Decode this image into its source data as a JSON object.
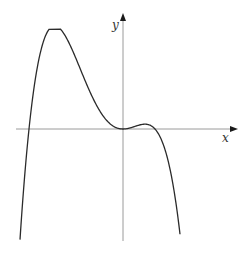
{
  "chart_data": {
    "type": "line",
    "title": "",
    "xlabel": "x",
    "ylabel": "y",
    "grid": false,
    "legend": null,
    "ticks": [],
    "features": {
      "roots_px": [
        29,
        123,
        155
      ],
      "double_root_at_origin": true,
      "global_min_px": [
        56,
        232
      ],
      "local_min_px": [
        145,
        133
      ]
    },
    "function_form": "k * x^2 * (x - a) * (x + b)",
    "series": [
      {
        "name": "f(x)",
        "color": "#2b2b2b"
      }
    ]
  },
  "labels": {
    "x": "x",
    "y": "y"
  },
  "colors": {
    "axis": "#999999",
    "curve": "#2b2b2b",
    "arrow": "#1a1a1a"
  }
}
